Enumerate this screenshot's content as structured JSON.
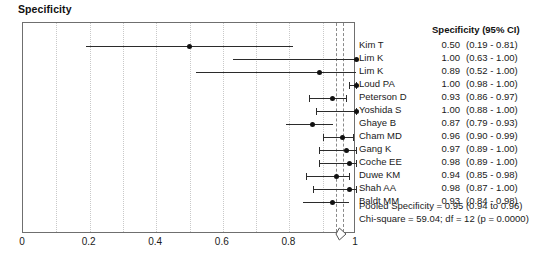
{
  "plot": {
    "title": "Specificity",
    "frame": {
      "x_min": 0,
      "x_max": 1
    },
    "x_ticks": [
      {
        "value": 0,
        "label": "0"
      },
      {
        "value": 0.2,
        "label": "0.2"
      },
      {
        "value": 0.4,
        "label": "0.4"
      },
      {
        "value": 0.6,
        "label": "0.6"
      },
      {
        "value": 0.8,
        "label": "0.8"
      },
      {
        "value": 1,
        "label": "1"
      }
    ],
    "gridline_values": [
      0.1,
      0.2,
      0.3,
      0.4,
      0.5,
      0.6,
      0.7,
      0.8,
      0.9
    ],
    "colors": {
      "frame": "#6f6f6f",
      "gridline": "#c9c9c9",
      "marker": "#111111",
      "ci_line": "#2b2b2b",
      "pooled_reference": "#8a8a8a",
      "text": "#1a1a1a"
    }
  },
  "table": {
    "header": "Specificity (95% CI)"
  },
  "chart_data": {
    "type": "forest",
    "title": "Specificity",
    "xlabel": "",
    "ylabel": "",
    "xlim": [
      0,
      1
    ],
    "grid": true,
    "effect_measure": "Specificity",
    "ci_level": "95%",
    "studies": [
      {
        "name": "Kim T",
        "estimate": 0.5,
        "lower": 0.19,
        "upper": 0.81,
        "estimate_label": "0.50",
        "ci_label": "(0.19 - 0.81)"
      },
      {
        "name": "Lim K",
        "estimate": 1.0,
        "lower": 0.63,
        "upper": 1.0,
        "estimate_label": "1.00",
        "ci_label": "(0.63 - 1.00)"
      },
      {
        "name": "Lim K",
        "estimate": 0.89,
        "lower": 0.52,
        "upper": 1.0,
        "estimate_label": "0.89",
        "ci_label": "(0.52 - 1.00)"
      },
      {
        "name": "Loud PA",
        "estimate": 1.0,
        "lower": 0.98,
        "upper": 1.0,
        "estimate_label": "1.00",
        "ci_label": "(0.98 - 1.00)"
      },
      {
        "name": "Peterson D",
        "estimate": 0.93,
        "lower": 0.86,
        "upper": 0.97,
        "estimate_label": "0.93",
        "ci_label": "(0.86 - 0.97)"
      },
      {
        "name": "Yoshida S",
        "estimate": 1.0,
        "lower": 0.88,
        "upper": 1.0,
        "estimate_label": "1.00",
        "ci_label": "(0.88 - 1.00)"
      },
      {
        "name": "Ghaye B",
        "estimate": 0.87,
        "lower": 0.79,
        "upper": 0.93,
        "estimate_label": "0.87",
        "ci_label": "(0.79 - 0.93)"
      },
      {
        "name": "Cham MD",
        "estimate": 0.96,
        "lower": 0.9,
        "upper": 0.99,
        "estimate_label": "0.96",
        "ci_label": "(0.90 - 0.99)"
      },
      {
        "name": "Gang K",
        "estimate": 0.97,
        "lower": 0.89,
        "upper": 1.0,
        "estimate_label": "0.97",
        "ci_label": "(0.89 - 1.00)"
      },
      {
        "name": "Coche EE",
        "estimate": 0.98,
        "lower": 0.89,
        "upper": 1.0,
        "estimate_label": "0.98",
        "ci_label": "(0.89 - 1.00)"
      },
      {
        "name": "Duwe KM",
        "estimate": 0.94,
        "lower": 0.85,
        "upper": 0.98,
        "estimate_label": "0.94",
        "ci_label": "(0.85 - 0.98)"
      },
      {
        "name": "Shah AA",
        "estimate": 0.98,
        "lower": 0.87,
        "upper": 1.0,
        "estimate_label": "0.98",
        "ci_label": "(0.87 - 1.00)"
      },
      {
        "name": "Baldt MM",
        "estimate": 0.93,
        "lower": 0.84,
        "upper": 0.98,
        "estimate_label": "0.93",
        "ci_label": "(0.84 - 0.98)"
      }
    ],
    "pooled": {
      "estimate": 0.95,
      "lower": 0.94,
      "upper": 0.96
    },
    "annotations": {
      "pooled_text": "Pooled Specificity = 0.95 (0.94 to 0.96)",
      "heterogeneity_text": "Chi-square = 59.04; df = 12 (p = 0.0000)"
    }
  }
}
